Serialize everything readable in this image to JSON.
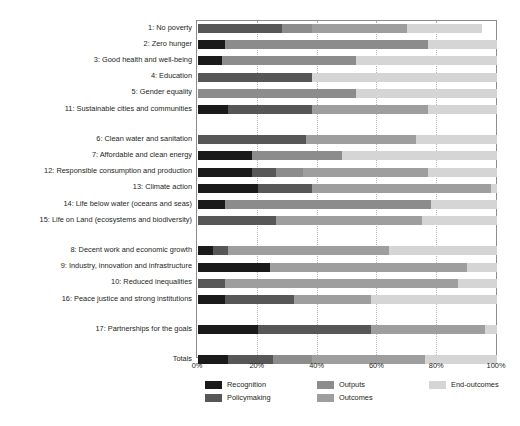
{
  "chart_data": {
    "type": "bar",
    "orientation": "horizontal",
    "stacked": true,
    "title": "",
    "xlabel": "",
    "ylabel": "",
    "xlim": [
      0,
      100
    ],
    "xticks": [
      0,
      20,
      40,
      60,
      80,
      100
    ],
    "xtick_labels": [
      "0%",
      "20%",
      "40%",
      "60%",
      "80%",
      "100%"
    ],
    "grid": true,
    "legend_position": "bottom-left",
    "series": [
      {
        "name": "Recognition",
        "color": "#1a1a1a"
      },
      {
        "name": "Policymaking",
        "color": "#575757"
      },
      {
        "name": "Outputs",
        "color": "#8c8c8c"
      },
      {
        "name": "Outcomes",
        "color": "#9e9e9e"
      },
      {
        "name": "End-outcomes",
        "color": "#d5d5d5"
      }
    ],
    "categories": [
      "1: No poverty",
      "2: Zero hunger",
      "3: Good health and well-being",
      "4: Education",
      "5: Gender equality",
      "11: Sustainable cities and communities",
      "6: Clean water and sanitation",
      "7: Affordable and clean energy",
      "12: Responsible consumption and production",
      "13: Climate action",
      "14: Life below water (oceans and seas)",
      "15: Life on Land (ecosystems and biodiversity)",
      "8: Decent work and economic growth",
      "9: Industry, innovation and infrastructure",
      "10: Reduced inequalities",
      "16: Peace justice and strong institutions",
      "17: Partnerships for the goals",
      "Totals"
    ],
    "group_breaks_after": [
      5,
      11,
      15,
      16
    ],
    "values": [
      {
        "category": "1: No poverty",
        "Recognition": 0,
        "Policymaking": 28,
        "Outputs": 10,
        "Outcomes": 32,
        "End-outcomes": 25
      },
      {
        "category": "2: Zero hunger",
        "Recognition": 9,
        "Policymaking": 0,
        "Outputs": 68,
        "Outcomes": 0,
        "End-outcomes": 23
      },
      {
        "category": "3: Good health and well-being",
        "Recognition": 8,
        "Policymaking": 0,
        "Outputs": 45,
        "Outcomes": 0,
        "End-outcomes": 47
      },
      {
        "category": "4: Education",
        "Recognition": 0,
        "Policymaking": 38,
        "Outputs": 0,
        "Outcomes": 0,
        "End-outcomes": 62
      },
      {
        "category": "5: Gender equality",
        "Recognition": 0,
        "Policymaking": 0,
        "Outputs": 53,
        "Outcomes": 0,
        "End-outcomes": 47
      },
      {
        "category": "11: Sustainable cities and communities",
        "Recognition": 10,
        "Policymaking": 28,
        "Outputs": 0,
        "Outcomes": 39,
        "End-outcomes": 23
      },
      {
        "category": "6: Clean water and sanitation",
        "Recognition": 0,
        "Policymaking": 36,
        "Outputs": 0,
        "Outcomes": 37,
        "End-outcomes": 27
      },
      {
        "category": "7: Affordable and clean energy",
        "Recognition": 18,
        "Policymaking": 0,
        "Outputs": 30,
        "Outcomes": 0,
        "End-outcomes": 52
      },
      {
        "category": "12: Responsible consumption and production",
        "Recognition": 18,
        "Policymaking": 8,
        "Outputs": 9,
        "Outcomes": 42,
        "End-outcomes": 23
      },
      {
        "category": "13: Climate action",
        "Recognition": 20,
        "Policymaking": 18,
        "Outputs": 0,
        "Outcomes": 60,
        "End-outcomes": 2
      },
      {
        "category": "14: Life below water (oceans and seas)",
        "Recognition": 9,
        "Policymaking": 0,
        "Outputs": 69,
        "Outcomes": 0,
        "End-outcomes": 22
      },
      {
        "category": "15: Life on Land (ecosystems and biodiversity)",
        "Recognition": 0,
        "Policymaking": 26,
        "Outputs": 0,
        "Outcomes": 49,
        "End-outcomes": 25
      },
      {
        "category": "8: Decent work and economic growth",
        "Recognition": 5,
        "Policymaking": 5,
        "Outputs": 0,
        "Outcomes": 54,
        "End-outcomes": 36
      },
      {
        "category": "9: Industry, innovation and infrastructure",
        "Recognition": 24,
        "Policymaking": 0,
        "Outputs": 0,
        "Outcomes": 66,
        "End-outcomes": 10
      },
      {
        "category": "10: Reduced inequalities",
        "Recognition": 0,
        "Policymaking": 9,
        "Outputs": 0,
        "Outcomes": 78,
        "End-outcomes": 13
      },
      {
        "category": "16: Peace justice and strong institutions",
        "Recognition": 9,
        "Policymaking": 23,
        "Outputs": 0,
        "Outcomes": 26,
        "End-outcomes": 42
      },
      {
        "category": "17: Partnerships for the goals",
        "Recognition": 20,
        "Policymaking": 38,
        "Outputs": 0,
        "Outcomes": 38,
        "End-outcomes": 4
      },
      {
        "category": "Totals",
        "Recognition": 10,
        "Policymaking": 15,
        "Outputs": 13,
        "Outcomes": 38,
        "End-outcomes": 24
      }
    ]
  },
  "legend": {
    "items": [
      {
        "label": "Recognition",
        "color": "#1a1a1a"
      },
      {
        "label": "Policymaking",
        "color": "#575757"
      },
      {
        "label": "Outputs",
        "color": "#8c8c8c"
      },
      {
        "label": "Outcomes",
        "color": "#9e9e9e"
      },
      {
        "label": "End-outcomes",
        "color": "#d5d5d5"
      }
    ]
  },
  "axis": {
    "x_tick_labels": [
      "0%",
      "20%",
      "40%",
      "60%",
      "80%",
      "100%"
    ]
  }
}
